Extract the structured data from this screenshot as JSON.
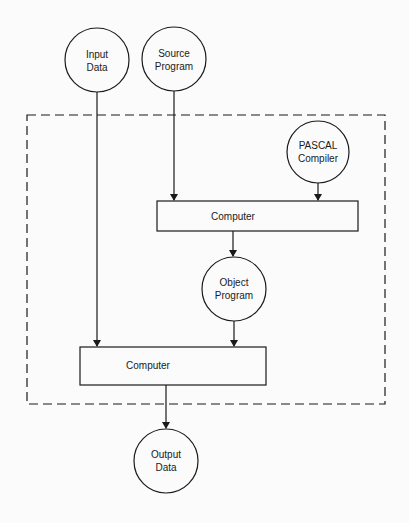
{
  "diagram": {
    "type": "flowchart",
    "nodes": {
      "input_data": {
        "shape": "circle",
        "lines": [
          "Input",
          "Data"
        ]
      },
      "source_program": {
        "shape": "circle",
        "lines": [
          "Source",
          "Program"
        ]
      },
      "pascal_compiler": {
        "shape": "circle",
        "lines": [
          "PASCAL",
          "Compiler"
        ]
      },
      "computer_1": {
        "shape": "rect",
        "label": "Computer"
      },
      "object_program": {
        "shape": "circle",
        "lines": [
          "Object",
          "Program"
        ]
      },
      "computer_2": {
        "shape": "rect",
        "label": "Computer"
      },
      "output_data": {
        "shape": "circle",
        "lines": [
          "Output",
          "Data"
        ]
      }
    },
    "edges": [
      {
        "from": "source_program",
        "to": "computer_1"
      },
      {
        "from": "pascal_compiler",
        "to": "computer_1"
      },
      {
        "from": "computer_1",
        "to": "object_program"
      },
      {
        "from": "object_program",
        "to": "computer_2"
      },
      {
        "from": "input_data",
        "to": "computer_2"
      },
      {
        "from": "computer_2",
        "to": "output_data"
      }
    ],
    "boundary": {
      "style": "dashed",
      "encloses": [
        "pascal_compiler",
        "computer_1",
        "object_program",
        "computer_2"
      ]
    },
    "colors": {
      "stroke": "#1a1a1a",
      "background": "#fbfbfb"
    }
  }
}
